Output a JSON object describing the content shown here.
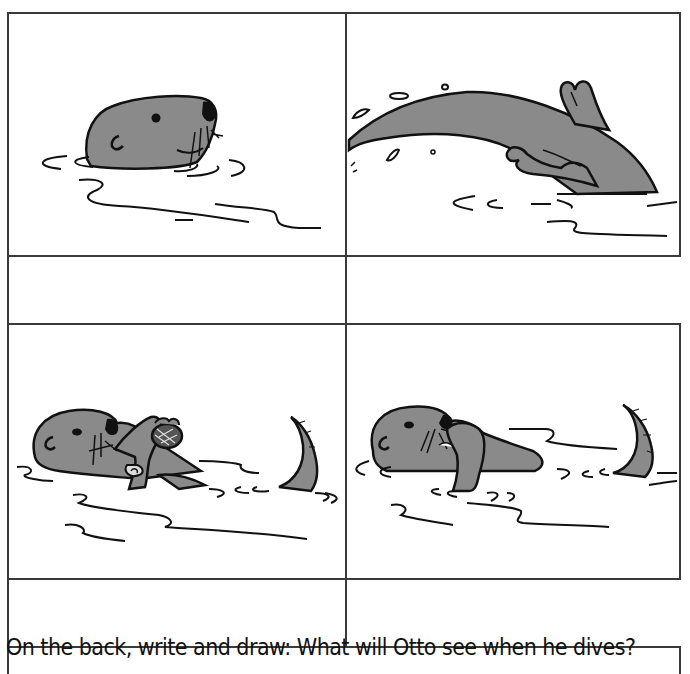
{
  "worksheet": {
    "title": "Otto sequence story worksheet",
    "panels": [
      {
        "position": "top-left",
        "illustration": "otter-head-peeking-from-water-icon",
        "writing_box": ""
      },
      {
        "position": "top-right",
        "illustration": "otter-diving-with-flippers-icon",
        "writing_box": ""
      },
      {
        "position": "bottom-left",
        "illustration": "otter-floating-on-back-holding-shell-icon",
        "writing_box": ""
      },
      {
        "position": "bottom-right",
        "illustration": "otter-floating-on-back-eating-icon",
        "writing_box": ""
      }
    ],
    "prompt": "On the back, write and draw: What will Otto see when he dives?",
    "colors": {
      "otter_fill": "#8a8a8a",
      "outline": "#111111",
      "grid_line": "#3a3a3a",
      "background": "#ffffff"
    }
  }
}
